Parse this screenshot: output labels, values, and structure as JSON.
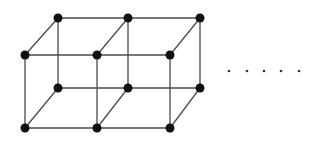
{
  "diagram": {
    "type": "cubic-lattice",
    "colors": {
      "edge": "#4a4a4a",
      "node": "#111111",
      "ellipsis": "#333333",
      "background": "#ffffff"
    },
    "nodes": [
      {
        "id": "front-top-0",
        "x": 25,
        "y": 55
      },
      {
        "id": "front-top-1",
        "x": 97,
        "y": 55
      },
      {
        "id": "front-top-2",
        "x": 170,
        "y": 55
      },
      {
        "id": "front-bottom-0",
        "x": 25,
        "y": 128
      },
      {
        "id": "front-bottom-1",
        "x": 97,
        "y": 128
      },
      {
        "id": "front-bottom-2",
        "x": 170,
        "y": 128
      },
      {
        "id": "back-top-0",
        "x": 58,
        "y": 18
      },
      {
        "id": "back-top-1",
        "x": 128,
        "y": 18
      },
      {
        "id": "back-top-2",
        "x": 200,
        "y": 18
      },
      {
        "id": "back-bottom-0",
        "x": 58,
        "y": 88
      },
      {
        "id": "back-bottom-1",
        "x": 128,
        "y": 88
      },
      {
        "id": "back-bottom-2",
        "x": 200,
        "y": 88
      }
    ],
    "edges": [
      [
        "front-top-0",
        "front-top-1"
      ],
      [
        "front-top-1",
        "front-top-2"
      ],
      [
        "front-bottom-0",
        "front-bottom-1"
      ],
      [
        "front-bottom-1",
        "front-bottom-2"
      ],
      [
        "back-top-0",
        "back-top-1"
      ],
      [
        "back-top-1",
        "back-top-2"
      ],
      [
        "back-bottom-0",
        "back-bottom-1"
      ],
      [
        "back-bottom-1",
        "back-bottom-2"
      ],
      [
        "front-top-0",
        "front-bottom-0"
      ],
      [
        "front-top-1",
        "front-bottom-1"
      ],
      [
        "front-top-2",
        "front-bottom-2"
      ],
      [
        "back-top-0",
        "back-bottom-0"
      ],
      [
        "back-top-1",
        "back-bottom-1"
      ],
      [
        "back-top-2",
        "back-bottom-2"
      ],
      [
        "front-top-0",
        "back-top-0"
      ],
      [
        "front-top-1",
        "back-top-1"
      ],
      [
        "front-top-2",
        "back-top-2"
      ],
      [
        "front-bottom-0",
        "back-bottom-0"
      ],
      [
        "front-bottom-1",
        "back-bottom-1"
      ],
      [
        "front-bottom-2",
        "back-bottom-2"
      ]
    ],
    "node_radius": 4.5,
    "ellipsis": {
      "count": 5,
      "y": 71,
      "x": [
        229,
        247,
        264,
        281,
        299
      ],
      "radius": 1.3
    }
  }
}
